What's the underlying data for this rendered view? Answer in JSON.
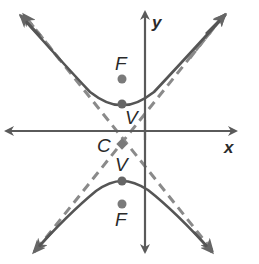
{
  "diagram": {
    "type": "hyperbola-graph",
    "colors": {
      "curve": "#555555",
      "axis": "#5a5a5a",
      "asymptote": "#8a8a8a",
      "point": "#7a7a7a",
      "label": "#2a2a2a"
    },
    "axes": {
      "x_label": "x",
      "y_label": "y"
    },
    "points": {
      "center": {
        "label": "C"
      },
      "vertex_upper": {
        "label": "V"
      },
      "vertex_lower": {
        "label": "V"
      },
      "focus_upper": {
        "label": "F"
      },
      "focus_lower": {
        "label": "F"
      }
    },
    "branches": [
      "upper branch opening up",
      "lower branch opening down"
    ],
    "asymptotes": [
      "dashed line with negative slope",
      "dashed line with positive slope"
    ]
  }
}
